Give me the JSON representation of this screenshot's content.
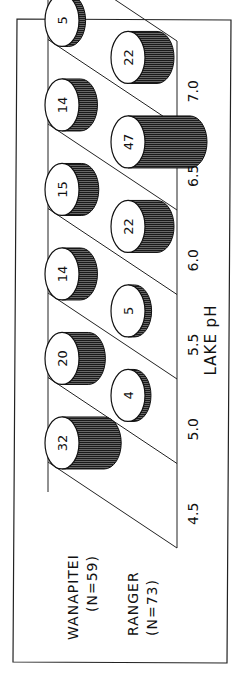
{
  "chart_data": {
    "type": "bar",
    "style": "3d-cylinder",
    "orientation": "rotated-90-ccw",
    "title": "",
    "xlabel": "LAKE pH",
    "ylabel": "",
    "categories": [
      "4.5",
      "5.0",
      "5.5",
      "6.0",
      "6.5",
      "7.0"
    ],
    "series": [
      {
        "name": "WANAPITEI",
        "n_label": "(N=59)",
        "values": [
          32,
          20,
          14,
          15,
          14,
          5
        ],
        "row": "back"
      },
      {
        "name": "RANGER",
        "n_label": "(N=73)",
        "values": [
          0,
          4,
          5,
          22,
          47,
          22
        ],
        "row": "front"
      }
    ],
    "grid": false,
    "legend_position": "bottom-left (rotated)",
    "colors": {
      "line": "#111111",
      "fill_dark": "#141414",
      "top_face": "#ffffff",
      "background": "#ffffff"
    }
  },
  "labels": {
    "axis_title": "LAKE pH",
    "ticks": [
      "4.5",
      "5.0",
      "5.5",
      "6.0",
      "6.5",
      "7.0"
    ],
    "legend": [
      {
        "name": "WANAPITEI",
        "n": "(N=59)"
      },
      {
        "name": "RANGER",
        "n": "(N=73)"
      }
    ]
  }
}
